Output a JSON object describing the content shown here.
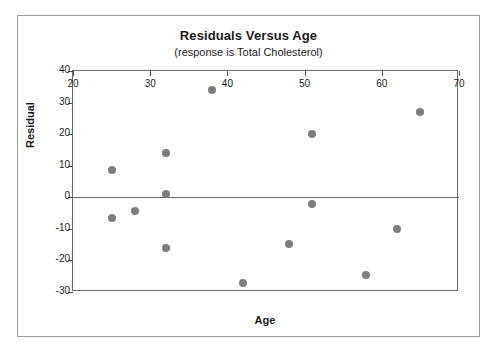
{
  "chart_data": {
    "type": "scatter",
    "title": "Residuals Versus Age",
    "subtitle": "(response is Total Cholesterol)",
    "xlabel": "Age",
    "ylabel": "Residual",
    "xlim": [
      20,
      70
    ],
    "ylim": [
      -30,
      40
    ],
    "xticks": [
      20,
      30,
      40,
      50,
      60,
      70
    ],
    "yticks": [
      40,
      30,
      20,
      10,
      0,
      -10,
      -20,
      -30
    ],
    "grid": false,
    "legend": null,
    "reference_lines": [
      {
        "name": "zero-residual-line",
        "axis": "y",
        "value": 0
      }
    ],
    "marker_color": "#7d7d7d",
    "frame_color": "#6b6b6b",
    "series": [
      {
        "name": "Residuals",
        "x": [
          25,
          25,
          28,
          32,
          32,
          32,
          38,
          42,
          48,
          51,
          51,
          58,
          62,
          65
        ],
        "y": [
          8.5,
          -6.5,
          -4.5,
          14,
          1,
          -16,
          34,
          -27,
          -14.7,
          20,
          -2,
          -24.5,
          -10,
          27
        ],
        "points": [
          {
            "x": 25,
            "y": 8.5
          },
          {
            "x": 25,
            "y": -6.5
          },
          {
            "x": 28,
            "y": -4.5
          },
          {
            "x": 32,
            "y": 14
          },
          {
            "x": 32,
            "y": 1
          },
          {
            "x": 32,
            "y": -16
          },
          {
            "x": 38,
            "y": 34
          },
          {
            "x": 42,
            "y": -27
          },
          {
            "x": 48,
            "y": -14.7
          },
          {
            "x": 51,
            "y": 20
          },
          {
            "x": 51,
            "y": -2
          },
          {
            "x": 58,
            "y": -24.5
          },
          {
            "x": 62,
            "y": -10
          },
          {
            "x": 65,
            "y": 27
          }
        ]
      }
    ]
  }
}
